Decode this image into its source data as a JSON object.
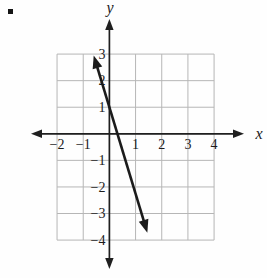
{
  "page": {
    "marker_icon": "square-bullet"
  },
  "chart_data": {
    "type": "line",
    "title": "",
    "xlabel": "x",
    "ylabel": "y",
    "xlim": [
      -2,
      4
    ],
    "ylim": [
      -4,
      3
    ],
    "grid": true,
    "x_tick_values": [
      -2,
      -1,
      1,
      2,
      3,
      4
    ],
    "x_tick_labels": [
      "−2",
      "−1",
      "1",
      "2",
      "3",
      "4"
    ],
    "y_tick_values": [
      3,
      2,
      1,
      -1,
      -2,
      -3,
      -4
    ],
    "y_tick_labels": [
      "3",
      "2",
      "1",
      "−1",
      "−2",
      "−3",
      "−4"
    ],
    "colors": {
      "grid": "#b6b6b6",
      "axis": "#1f1f1f",
      "line": "#1b1b1b",
      "text": "#1b1b1b"
    },
    "series": [
      {
        "name": "graphed-line",
        "equation": "y = -3x + 1",
        "slope": -3,
        "y_intercept": 1,
        "x_intercept": 0.33,
        "arrows_both_ends": true,
        "draw_from": {
          "x": -0.6,
          "y": 2.95
        },
        "draw_to": {
          "x": 1.45,
          "y": -3.72
        }
      }
    ]
  }
}
